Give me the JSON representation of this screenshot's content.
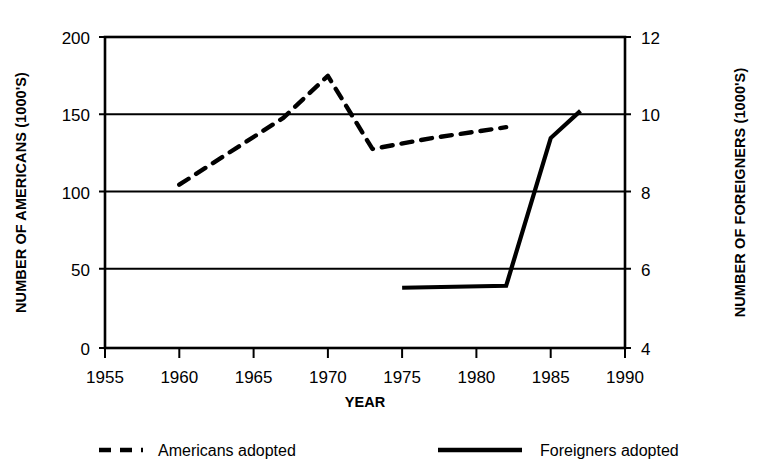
{
  "chart_data": {
    "type": "line",
    "title": "",
    "xlabel": "YEAR",
    "ylabel": "NUMBER OF AMERICANS (1000'S)",
    "y2label": "NUMBER OF FOREIGNERS (1000'S)",
    "xlim": [
      1955,
      1990
    ],
    "ylim": [
      0,
      200
    ],
    "y2lim": [
      4,
      12
    ],
    "xticks": [
      1955,
      1960,
      1965,
      1970,
      1975,
      1980,
      1985,
      1990
    ],
    "xtick_labels": [
      "1955",
      "1960",
      "1965",
      "1970",
      "1975",
      "1980",
      "1985",
      "1990"
    ],
    "yticks": [
      0,
      50,
      100,
      150,
      200
    ],
    "ytick_labels": [
      "0",
      "50",
      "100",
      "150",
      "200"
    ],
    "y2ticks": [
      4,
      6,
      8,
      10,
      12
    ],
    "y2tick_labels": [
      "4",
      "6",
      "8",
      "10",
      "12"
    ],
    "grid": "horizontal",
    "legend_position": "below",
    "series": [
      {
        "name": "Americans adopted",
        "axis": "left",
        "style": "dashed",
        "color": "#000000",
        "x": [
          1960,
          1967,
          1970,
          1973,
          1977,
          1982
        ],
        "values": [
          105,
          148,
          175,
          128,
          135,
          142
        ]
      },
      {
        "name": "Foreigners adopted",
        "axis": "right",
        "style": "solid",
        "color": "#000000",
        "x": [
          1975,
          1982,
          1985,
          1987
        ],
        "values": [
          5.55,
          5.6,
          9.4,
          10.1
        ]
      }
    ]
  },
  "legend": {
    "items": [
      {
        "label": "Americans adopted",
        "style": "dashed"
      },
      {
        "label": "Foreigners adopted",
        "style": "solid"
      }
    ]
  }
}
